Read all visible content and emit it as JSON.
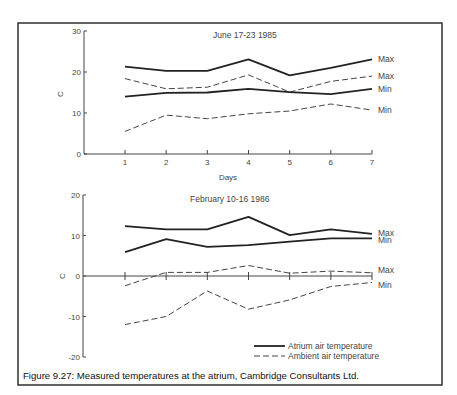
{
  "caption": "Figure 9.27: Measured temperatures at the atrium, Cambridge Consultants Ltd.",
  "legend": {
    "atrium": "Atrium air temperature",
    "ambient": "Ambient air temperature"
  },
  "chart_data": [
    {
      "type": "line",
      "title": "June 17-23 1985",
      "xlabel": "Days",
      "ylabel": "C",
      "x": [
        1,
        2,
        3,
        4,
        5,
        6,
        7
      ],
      "xticks": [
        "1",
        "2",
        "3",
        "4",
        "5",
        "6",
        "7"
      ],
      "ylim": [
        0,
        30
      ],
      "yticks": [
        "0",
        "10",
        "20",
        "30"
      ],
      "yticks_values": [
        0,
        10,
        20,
        30
      ],
      "grid": false,
      "series": [
        {
          "name": "Atrium Max",
          "group": "atrium",
          "label": "Max",
          "style": "solid",
          "values": [
            21.3,
            20.3,
            20.3,
            23.1,
            19.2,
            21.0,
            23.1
          ]
        },
        {
          "name": "Ambient Max",
          "group": "ambient",
          "label": "Max",
          "style": "dashed",
          "values": [
            18.4,
            15.9,
            16.3,
            19.3,
            15.1,
            17.7,
            19.0
          ]
        },
        {
          "name": "Atrium Min",
          "group": "atrium",
          "label": "Min",
          "style": "solid",
          "values": [
            14.0,
            14.9,
            15.0,
            15.9,
            15.1,
            14.6,
            15.9
          ]
        },
        {
          "name": "Ambient Min",
          "group": "ambient",
          "label": "Min",
          "style": "dashed",
          "values": [
            5.5,
            9.5,
            8.6,
            9.8,
            10.5,
            12.2,
            10.7
          ]
        }
      ]
    },
    {
      "type": "line",
      "title": "February 10-16 1986",
      "xlabel": "",
      "ylabel": "C",
      "x": [
        1,
        2,
        3,
        4,
        5,
        6,
        7
      ],
      "ylim": [
        -20,
        20
      ],
      "yticks": [
        "-20",
        "-10",
        "0",
        "10",
        "20"
      ],
      "yticks_values": [
        -20,
        -10,
        0,
        10,
        20
      ],
      "grid": false,
      "legend_position": "bottom-right",
      "series": [
        {
          "name": "Atrium Max",
          "group": "atrium",
          "label": "Max",
          "style": "solid",
          "values": [
            12.3,
            11.5,
            11.5,
            14.6,
            10.1,
            11.5,
            10.4
          ]
        },
        {
          "name": "Atrium Min",
          "group": "atrium",
          "label": "Min",
          "style": "solid",
          "values": [
            5.9,
            9.1,
            7.2,
            7.6,
            8.5,
            9.3,
            9.3
          ]
        },
        {
          "name": "Ambient Max",
          "group": "ambient",
          "label": "Max",
          "style": "dashed",
          "values": [
            -2.4,
            0.9,
            0.9,
            2.6,
            0.7,
            1.2,
            0.8
          ]
        },
        {
          "name": "Ambient Min",
          "group": "ambient",
          "label": "Min",
          "style": "dashed",
          "values": [
            -12.0,
            -10.0,
            -3.7,
            -8.2,
            -5.9,
            -2.6,
            -1.6
          ]
        }
      ]
    }
  ]
}
